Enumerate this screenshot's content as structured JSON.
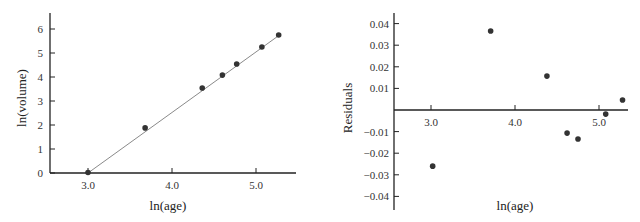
{
  "chart_data": [
    {
      "type": "scatter",
      "title": "",
      "xlabel": "ln(age)",
      "ylabel": "ln(volume)",
      "xlim": [
        2.75,
        5.5
      ],
      "ylim": [
        0,
        6.6
      ],
      "xticks": [
        "3.0",
        "4.0",
        "5.0"
      ],
      "yticks": [
        "0",
        "1",
        "2",
        "3",
        "4",
        "5",
        "6"
      ],
      "grid": false,
      "fit_line": {
        "from": [
          3.0,
          0.0
        ],
        "to": [
          5.28,
          5.75
        ]
      },
      "x": [
        3.0,
        3.68,
        4.36,
        4.6,
        4.77,
        5.07,
        5.27
      ],
      "y": [
        0.02,
        1.88,
        3.54,
        4.08,
        4.54,
        5.25,
        5.75
      ]
    },
    {
      "type": "scatter",
      "title": "",
      "xlabel": "ln(age)",
      "ylabel": "Residuals",
      "xlim": [
        2.55,
        5.85
      ],
      "ylim": [
        -0.045,
        0.045
      ],
      "xticks": [
        "3.0",
        "4.0",
        "5.0"
      ],
      "yticks": [
        "0.04",
        "0.03",
        "0.02",
        "0.01",
        "-0.01",
        "-0.02",
        "-0.03",
        "-0.04"
      ],
      "grid": false,
      "x": [
        3.02,
        3.71,
        4.38,
        4.62,
        4.75,
        5.08,
        5.28
      ],
      "y": [
        -0.026,
        0.0366,
        0.0157,
        -0.0107,
        -0.0134,
        -0.0019,
        0.0046
      ]
    }
  ],
  "left": {
    "ylabel": "ln(volume)",
    "xlabel": "ln(age)",
    "xticks": [
      "3.0",
      "4.0",
      "5.0"
    ],
    "yticks": [
      "0",
      "1",
      "2",
      "3",
      "4",
      "5",
      "6"
    ]
  },
  "right": {
    "ylabel": "Residuals",
    "xlabel": "ln(age)",
    "xticks": [
      "3.0",
      "4.0",
      "5.0"
    ],
    "yticks": [
      "0.04",
      "0.03",
      "0.02",
      "0.01",
      "-0.01",
      "-0.02",
      "-0.03",
      "-0.04"
    ]
  },
  "colors": {
    "point": "#333333",
    "fit_line": "#8a8a8a",
    "axis": "#222222"
  }
}
